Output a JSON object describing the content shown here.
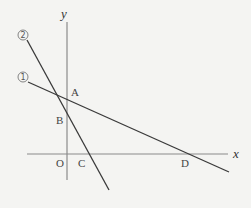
{
  "diagram": {
    "type": "coordinate-plane",
    "axes": {
      "x_label": "x",
      "y_label": "y",
      "origin_label": "O"
    },
    "lines": [
      {
        "id": "line-1",
        "label": "①",
        "number": "1",
        "x1": 28,
        "y1": 82,
        "x2": 229,
        "y2": 172
      },
      {
        "id": "line-2",
        "label": "②",
        "number": "2",
        "x1": 27,
        "y1": 40,
        "x2": 109,
        "y2": 190
      }
    ],
    "points": {
      "A": {
        "label": "A",
        "description": "intersection of line ① with y-axis"
      },
      "B": {
        "label": "B",
        "description": "intersection of line ② with y-axis"
      },
      "C": {
        "label": "C",
        "description": "intersection of line ② with x-axis"
      },
      "D": {
        "label": "D",
        "description": "intersection of line ① with x-axis"
      }
    }
  }
}
